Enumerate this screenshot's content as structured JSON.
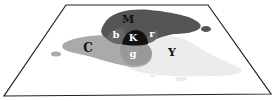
{
  "diagram": {
    "plane": {
      "corners": [
        [
          66,
          5
        ],
        [
          208,
          5
        ],
        [
          271,
          94
        ],
        [
          4,
          96
        ]
      ],
      "fill": "#ffffff",
      "stroke": "#222222"
    },
    "regions": [
      {
        "id": "M",
        "label": "M",
        "name": "magenta",
        "color": "#555555"
      },
      {
        "id": "C",
        "label": "C",
        "name": "cyan",
        "color": "#aaaaaa"
      },
      {
        "id": "Y",
        "label": "Y",
        "name": "yellow",
        "color": "#ececec"
      },
      {
        "id": "K",
        "label": "K",
        "name": "black",
        "color": "#111111"
      },
      {
        "id": "b",
        "label": "b",
        "name": "blue",
        "color": "#666666"
      },
      {
        "id": "r",
        "label": "r",
        "name": "red",
        "color": "#666666"
      },
      {
        "id": "g",
        "label": "g",
        "name": "green",
        "color": "#999999"
      }
    ]
  }
}
